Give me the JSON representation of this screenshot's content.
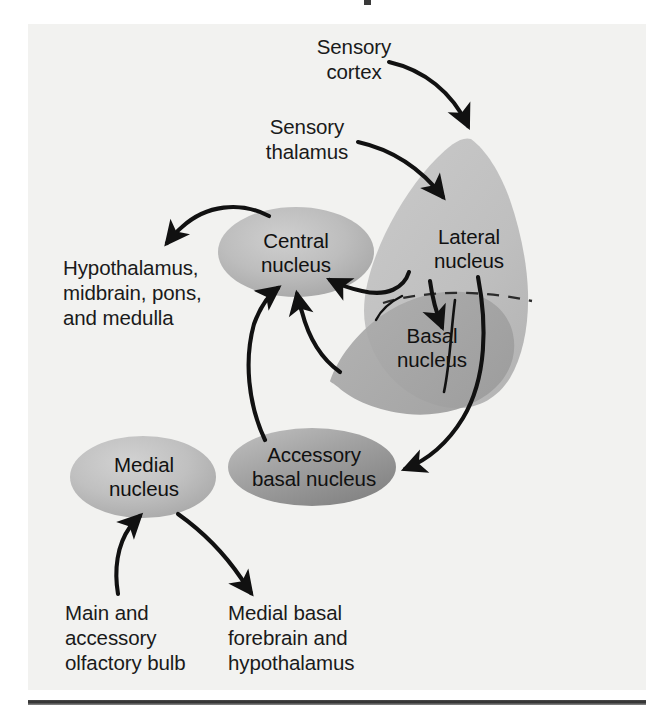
{
  "figure": {
    "background_color": "#f2f2f0",
    "page_color": "#ffffff",
    "ink_color": "#111111"
  },
  "nuclei": [
    {
      "id": "central",
      "label": "Central\nnucleus",
      "shape": "ellipse",
      "fill": "#b8b8b8"
    },
    {
      "id": "lateral",
      "label": "Lateral\nnucleus",
      "shape": "region",
      "fill": "#c4c4c4"
    },
    {
      "id": "basal",
      "label": "Basal\nnucleus",
      "shape": "region",
      "fill": "#ababab"
    },
    {
      "id": "accessory_basal",
      "label": "Accessory\nbasal nucleus",
      "shape": "ellipse",
      "fill": "#9a9a9a"
    },
    {
      "id": "medial",
      "label": "Medial\nnucleus",
      "shape": "ellipse",
      "fill": "#bdbdbd"
    }
  ],
  "inputs": [
    {
      "id": "sensory_cortex",
      "label": "Sensory\ncortex"
    },
    {
      "id": "sensory_thalamus",
      "label": "Sensory\nthalamus"
    },
    {
      "id": "olfactory_bulb",
      "label": "Main and\naccessory\nolfactory bulb"
    }
  ],
  "outputs": [
    {
      "id": "brainstem_targets",
      "label": "Hypothalamus,\nmidbrain, pons,\nand medulla"
    },
    {
      "id": "forebrain_targets",
      "label": "Medial basal\nforebrain and\nhypothalamus"
    }
  ],
  "connections": [
    {
      "from": "sensory_cortex",
      "to": "lateral",
      "style": "solid-arrow"
    },
    {
      "from": "sensory_thalamus",
      "to": "lateral",
      "style": "solid-arrow"
    },
    {
      "from": "lateral",
      "to": "basal",
      "style": "solid-arrow"
    },
    {
      "from": "lateral",
      "to": "central",
      "style": "solid-arrow"
    },
    {
      "from": "lateral",
      "to": "accessory_basal",
      "style": "solid-arrow"
    },
    {
      "from": "basal",
      "to": "central",
      "style": "solid-arrow"
    },
    {
      "from": "accessory_basal",
      "to": "central",
      "style": "solid-arrow"
    },
    {
      "from": "central",
      "to": "brainstem_targets",
      "style": "solid-arrow"
    },
    {
      "from": "olfactory_bulb",
      "to": "medial",
      "style": "solid-arrow"
    },
    {
      "from": "medial",
      "to": "forebrain_targets",
      "style": "solid-arrow"
    }
  ],
  "boundary": {
    "id": "lateral_basal_divider",
    "style": "dashed"
  }
}
